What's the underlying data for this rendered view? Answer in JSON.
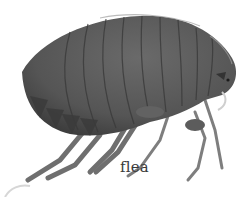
{
  "image": {
    "subject": "flea illustration",
    "label": "flea",
    "colors": {
      "body": "#5a5a5a",
      "body_dark": "#3f3f3f",
      "highlight": "#9a9a9a",
      "legs": "#7a7a7a",
      "background": "#ffffff"
    }
  }
}
